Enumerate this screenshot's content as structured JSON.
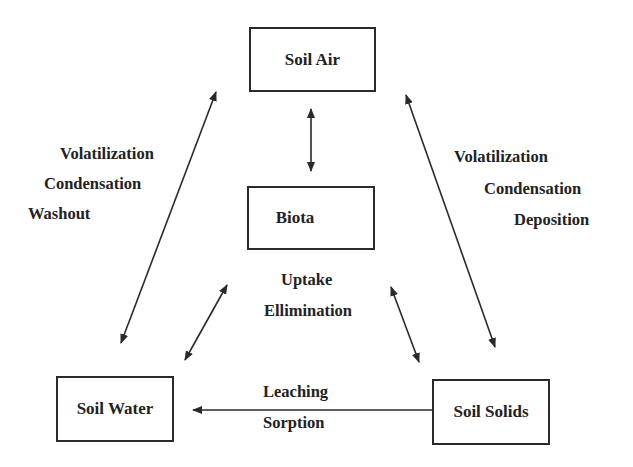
{
  "nodes": {
    "soil_air": "Soil Air",
    "biota": "Biota",
    "soil_water": "Soil Water",
    "soil_solids": "Soil Solids"
  },
  "edge_labels": {
    "air_water": [
      "Volatilization",
      "Condensation",
      "Washout"
    ],
    "air_solids": [
      "Volatilization",
      "Condensation",
      "Deposition"
    ],
    "biota_exchange": [
      "Uptake",
      "Ellimination"
    ],
    "water_solids": [
      "Leaching",
      "Sorption"
    ]
  },
  "colors": {
    "line": "#2a2a2a",
    "background": "#ffffff"
  }
}
